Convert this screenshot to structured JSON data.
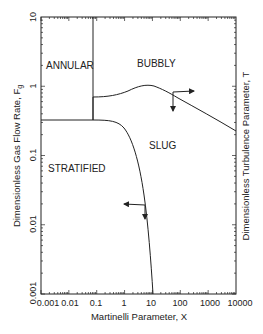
{
  "chart_data": {
    "type": "line",
    "title": "",
    "xlabel": "Martinelli Parameter, X",
    "ylabel": "Dimensionless Gas Flow Rate, F",
    "ylabel_subscript": "g",
    "ylabel_right": "Dimensionless Turbulence Parameter, T",
    "xscale": "log",
    "yscale": "log",
    "xlim": [
      0.001,
      10000
    ],
    "ylim": [
      0.001,
      10
    ],
    "x_tick_labels": [
      "0.001",
      "0.01",
      "0.1",
      "1",
      "10",
      "100",
      "1000",
      "10000"
    ],
    "y_tick_labels": [
      "0.001",
      "0.01",
      "0.1",
      "1",
      "10"
    ],
    "grid": false,
    "legend": null,
    "regions": [
      {
        "label": "ANNULAR",
        "x": 0.003,
        "y": 3
      },
      {
        "label": "BUBBLY",
        "x": 20,
        "y": 2.5
      },
      {
        "label": "SLUG",
        "x": 30,
        "y": 0.2
      },
      {
        "label": "STRATIFIED",
        "x": 0.005,
        "y": 0.07
      }
    ],
    "series": [
      {
        "name": "annular-boundary (vertical)",
        "x": [
          0.08,
          0.08
        ],
        "y": [
          10,
          0.35
        ]
      },
      {
        "name": "stratified-slug boundary",
        "x": [
          0.001,
          0.08,
          0.5,
          1.5,
          4,
          8,
          20,
          50,
          100,
          150
        ],
        "y": [
          0.35,
          0.35,
          0.34,
          0.3,
          0.2,
          0.1,
          0.03,
          0.008,
          0.002,
          0.001
        ]
      },
      {
        "name": "bubbly boundary",
        "x": [
          0.08,
          0.3,
          1,
          3,
          10,
          30,
          100,
          1000,
          10000
        ],
        "y": [
          0.75,
          0.78,
          0.85,
          0.97,
          1.05,
          0.95,
          0.75,
          0.45,
          0.27
        ]
      }
    ],
    "annotations": [
      {
        "type": "arrow-pair",
        "at": [
          50,
          0.9
        ],
        "directions": [
          "right",
          "down"
        ]
      },
      {
        "type": "arrow-pair",
        "at": [
          6,
          0.14
        ],
        "directions": [
          "left",
          "down"
        ]
      }
    ]
  }
}
